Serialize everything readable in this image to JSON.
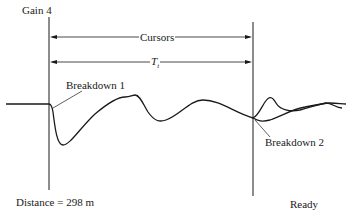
{
  "display": {
    "gain_label": "Gain 4",
    "status": "Ready",
    "distance_label": "Distance = 298 m"
  },
  "cursors": {
    "label": "Cursors",
    "time_label": "T",
    "time_subscript": "t",
    "left_cursor_x": 49,
    "right_cursor_x": 253
  },
  "annotations": {
    "breakdown_1": "Breakdown 1",
    "breakdown_2": "Breakdown 2"
  },
  "colors": {
    "trace": "#1a1a1a",
    "background": "#ffffff"
  }
}
